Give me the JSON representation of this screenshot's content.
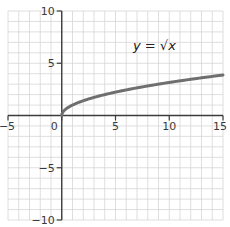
{
  "chart_data": {
    "type": "line",
    "title": "",
    "annotation": "y = √x",
    "xlabel": "",
    "ylabel": "",
    "xlim": [
      -5,
      15
    ],
    "ylim": [
      -10,
      10
    ],
    "grid": true,
    "grid_step": 1,
    "x_ticks": [
      -5,
      0,
      5,
      10,
      15
    ],
    "x_tick_labels": [
      "−5",
      "0",
      "5",
      "10",
      "15"
    ],
    "y_ticks": [
      -10,
      -5,
      5,
      10
    ],
    "y_tick_labels": [
      "−10",
      "−5",
      "5",
      "10"
    ],
    "series": [
      {
        "name": "y = √x",
        "function": "sqrt",
        "x": [
          0,
          0.25,
          1,
          2,
          4,
          6,
          9,
          12,
          15
        ],
        "y": [
          0,
          0.5,
          1,
          1.41,
          2,
          2.45,
          3,
          3.46,
          3.87
        ],
        "color": "#6f6f6f"
      }
    ]
  },
  "colors": {
    "grid": "#d6d6d6",
    "axis": "#3c3c3c",
    "curve": "#6f6f6f"
  }
}
